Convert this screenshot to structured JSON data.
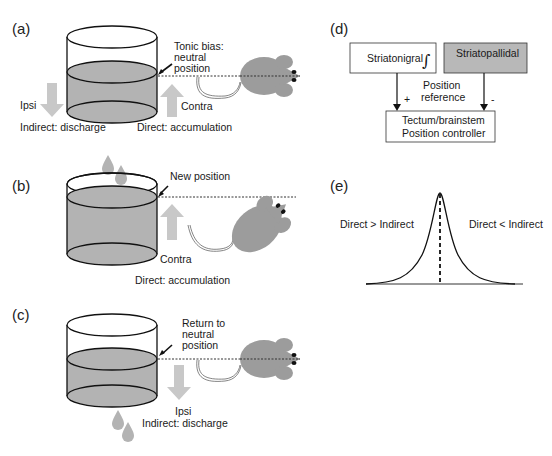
{
  "panels": {
    "a": {
      "label": "(a)",
      "annotation_line1": "Tonic bias:",
      "annotation_line2": "neutral",
      "annotation_line3": "position",
      "left_arrow_label": "Ipsi",
      "right_arrow_label": "Contra",
      "bottom_left": "Indirect: discharge",
      "bottom_right": "Direct: accumulation"
    },
    "b": {
      "label": "(b)",
      "annotation": "New position",
      "arrow_label": "Contra",
      "bottom": "Direct: accumulation"
    },
    "c": {
      "label": "(c)",
      "annotation_line1": "Return to",
      "annotation_line2": "neutral",
      "annotation_line3": "position",
      "arrow_label": "Ipsi",
      "bottom": "Indirect: discharge"
    },
    "d": {
      "label": "(d)",
      "box_left": "Striatonigral",
      "integral_symbol": "∫",
      "box_right": "Striatopallidal",
      "middle_line1": "Position",
      "middle_line2": "reference",
      "plus": "+",
      "minus": "-",
      "box_bottom_line1": "Tectum/brainstem",
      "box_bottom_line2": "Position controller"
    },
    "e": {
      "label": "(e)",
      "left_text": "Direct > Indirect",
      "right_text": "Direct < Indirect"
    }
  },
  "colors": {
    "liquid": "#b3b3b3",
    "arrow": "#c8c8c8",
    "mouse": "#9c9c9c",
    "box_gray": "#b8b8b8",
    "stroke": "#111111"
  }
}
